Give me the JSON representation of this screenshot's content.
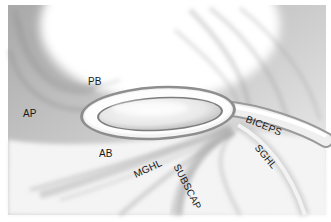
{
  "figure": {
    "labels": {
      "pb": "PB",
      "ap": "AP",
      "ab": "AB",
      "mghl": "MGHL",
      "subscap": "SUBSCAP",
      "biceps": "BICEPS",
      "sghl": "SGHL"
    },
    "colors": {
      "background": "#ffffff",
      "tissue_dark": "#8a8a8a",
      "tissue_mid": "#b8b8b8",
      "tissue_light": "#e6e6e6",
      "label_text": "#1a1a1a"
    }
  }
}
